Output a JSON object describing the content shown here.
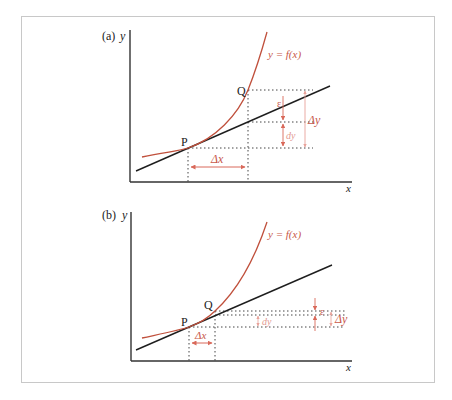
{
  "figure": {
    "colors": {
      "axis": "#333333",
      "tangent": "#1e1e1e",
      "curve": "#c0503c",
      "annotation": "#d9695a",
      "annotation_light": "#e8a29a",
      "dotted": "#444444",
      "frame": "#c8c8c8"
    },
    "panels": [
      {
        "id": "a",
        "panel_label": "(a)",
        "y_axis_label": "y",
        "x_axis_label": "x",
        "curve_label": "y = f(x)",
        "point_p_label": "P",
        "point_q_label": "Q",
        "delta_x_label": "Δx",
        "delta_y_label": "Δy",
        "dy_label": "dy",
        "epsilon_label": "ε"
      },
      {
        "id": "b",
        "panel_label": "(b)",
        "y_axis_label": "y",
        "x_axis_label": "x",
        "curve_label": "y = f(x)",
        "point_p_label": "P",
        "point_q_label": "Q",
        "delta_x_label": "Δx",
        "delta_y_label": "Δy",
        "dy_label": "dy",
        "epsilon_label": "ε"
      }
    ]
  }
}
